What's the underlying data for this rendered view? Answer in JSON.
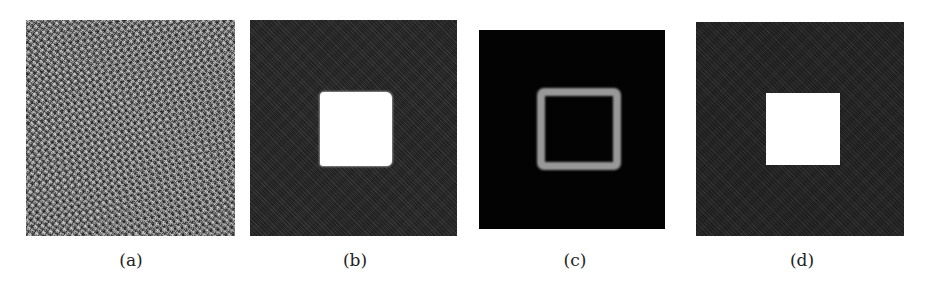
{
  "figure": {
    "panels": [
      {
        "id": "a",
        "label": "(a)",
        "description": "random noise image"
      },
      {
        "id": "b",
        "label": "(b)",
        "description": "noisy dark background with bright irregular square"
      },
      {
        "id": "c",
        "label": "(c)",
        "description": "black background with blurred bright square outline"
      },
      {
        "id": "d",
        "label": "(d)",
        "description": "noisy dark background with clean white square"
      }
    ]
  },
  "colors": {
    "noise_gray": "#7a7a7a",
    "dark_background": "#2a2a2a",
    "black_background": "#030303",
    "ring_gray": "#a9a9a9",
    "white": "#ffffff"
  }
}
